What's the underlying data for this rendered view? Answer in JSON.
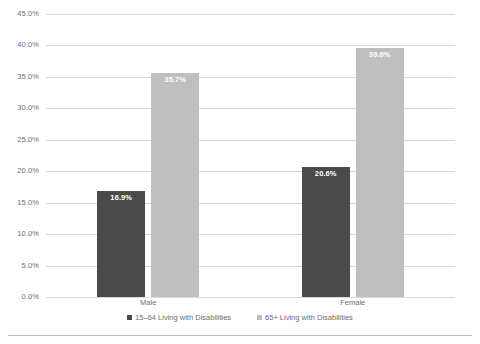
{
  "chart_data": {
    "type": "bar",
    "title": "",
    "xlabel": "",
    "ylabel": "",
    "categories": [
      "Male",
      "Female"
    ],
    "series": [
      {
        "name": "15–64 Living with Disabilities",
        "color": "#4a4a4a",
        "values": [
          16.9,
          20.6
        ],
        "labels": [
          "16.9%",
          "20.6%"
        ]
      },
      {
        "name": "65+ Living with Disabilities",
        "color": "#bfbfbf",
        "values": [
          35.7,
          39.6
        ],
        "labels": [
          "35.7%",
          "39.6%"
        ]
      }
    ],
    "ylim": [
      0,
      45
    ],
    "ytick_step": 5,
    "ytick_labels": [
      "45.0%",
      "40.0%",
      "35.0%",
      "30.0%",
      "25.0%",
      "20.0%",
      "15.0%",
      "10.0%",
      "5.0%",
      "0.0%"
    ],
    "ytick_values": [
      45,
      40,
      35,
      30,
      25,
      20,
      15,
      10,
      5,
      0
    ],
    "grid": true,
    "legend_position": "bottom"
  },
  "colors": {
    "series_dark": "#4a4a4a",
    "series_light": "#bfbfbf",
    "gridline": "#d9d9d9",
    "frame_rule": "#bcbcbc",
    "text": "#6e6e6e",
    "data_label": "#ffffff"
  }
}
